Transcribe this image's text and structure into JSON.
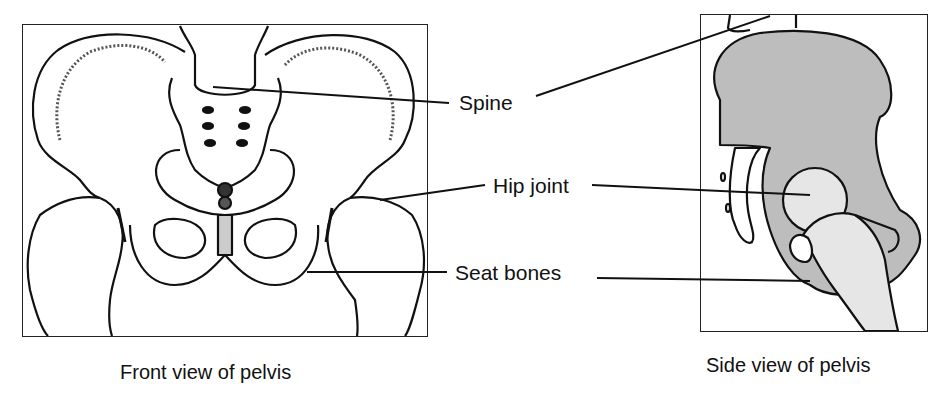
{
  "diagram": {
    "labels": {
      "spine": "Spine",
      "hip_joint": "Hip joint",
      "seat_bones": "Seat bones"
    },
    "captions": {
      "front": "Front view of pelvis",
      "side": "Side view of pelvis"
    },
    "colors": {
      "line": "#111111",
      "bone_shade": "#bdbdbd",
      "bone_light": "#e6e6e6",
      "background": "#ffffff"
    }
  }
}
